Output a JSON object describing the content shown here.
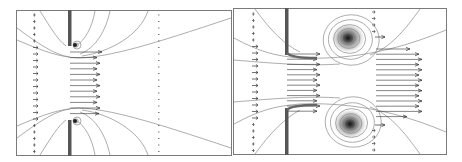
{
  "figure": {
    "panels": [
      {
        "id": "left",
        "label": "Flow through aperture - early",
        "wall_color": "#555555",
        "arrow_color": "#333333",
        "contour_color": "#8a8a8a",
        "frame_color": "#7a7a7a",
        "jet_arrow_rows": 12,
        "inlet_arrow_rows": 22,
        "outlet_arrow_rows": 22,
        "vortex_strength": 0.25
      },
      {
        "id": "right",
        "label": "Flow through aperture - later",
        "wall_color": "#555555",
        "arrow_color": "#333333",
        "contour_color": "#8a8a8a",
        "frame_color": "#7a7a7a",
        "jet_arrow_rows": 12,
        "inlet_arrow_rows": 22,
        "outlet_arrow_rows": 8,
        "vortex_strength": 1.0
      }
    ]
  }
}
